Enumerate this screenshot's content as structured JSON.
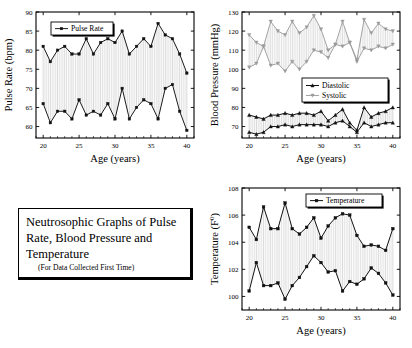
{
  "figure": {
    "caption": {
      "title_line1": "Neutrosophic Graphs of Pulse",
      "title_line2": "Rate, Blood Pressure and",
      "title_line3": "Temperature",
      "subtitle": "(For Data Collected First Time)"
    }
  },
  "chart_data": [
    {
      "id": "pulse",
      "type": "line",
      "title": "",
      "xlabel": "Age (years)",
      "ylabel": "Pulse Rate (bpm)",
      "xlim": [
        19,
        41
      ],
      "ylim": [
        57,
        90
      ],
      "xticks": [
        20,
        25,
        30,
        35,
        40
      ],
      "yticks": [
        60,
        65,
        70,
        75,
        80,
        85,
        90
      ],
      "grid": false,
      "legend": [
        "Pulse Rate"
      ],
      "legend_position": "top-left-inside",
      "x": [
        20,
        21,
        22,
        23,
        24,
        25,
        26,
        27,
        28,
        29,
        30,
        31,
        32,
        33,
        34,
        35,
        36,
        37,
        38,
        39,
        40
      ],
      "series": [
        {
          "name": "Pulse Rate Upper",
          "values": [
            81,
            77,
            80,
            81,
            79,
            79,
            83,
            79,
            82,
            83,
            82,
            85,
            79,
            81,
            83,
            81,
            87,
            84,
            83,
            79,
            74
          ]
        },
        {
          "name": "Pulse Rate Lower",
          "values": [
            66,
            61,
            64,
            64,
            62,
            67,
            63,
            64,
            63,
            66,
            62,
            70,
            62,
            65,
            67,
            66,
            62,
            70,
            71,
            64,
            59
          ]
        }
      ]
    },
    {
      "id": "blood-pressure",
      "type": "line",
      "title": "",
      "xlabel": "Age (years)",
      "ylabel": "Blood Pressure (mmHg)",
      "xlim": [
        19,
        41
      ],
      "ylim": [
        64,
        130
      ],
      "xticks": [
        20,
        25,
        30,
        35,
        40
      ],
      "yticks": [
        70,
        80,
        90,
        100,
        110,
        120,
        130
      ],
      "grid": false,
      "legend": [
        "Diastolic",
        "Systolic"
      ],
      "legend_position": "center-right-inside",
      "x": [
        20,
        21,
        22,
        23,
        24,
        25,
        26,
        27,
        28,
        29,
        30,
        31,
        32,
        33,
        34,
        35,
        36,
        37,
        38,
        39,
        40
      ],
      "series": [
        {
          "name": "Systolic Upper",
          "values": [
            118,
            114,
            112,
            125,
            120,
            118,
            125,
            119,
            122,
            128,
            121,
            110,
            113,
            125,
            114,
            105,
            126,
            119,
            124,
            121,
            120
          ]
        },
        {
          "name": "Systolic Lower",
          "values": [
            101,
            103,
            112,
            102,
            103,
            99,
            104,
            100,
            104,
            110,
            109,
            106,
            113,
            112,
            114,
            104,
            111,
            110,
            112,
            111,
            113
          ]
        },
        {
          "name": "Diastolic Upper",
          "values": [
            76,
            75,
            74,
            76,
            76,
            77,
            76,
            77,
            77,
            76,
            78,
            73,
            76,
            79,
            72,
            68,
            80,
            75,
            77,
            78,
            80
          ]
        },
        {
          "name": "Diastolic Lower",
          "values": [
            67,
            66,
            67,
            70,
            70,
            71,
            70,
            71,
            71,
            71,
            71,
            70,
            72,
            73,
            70,
            67,
            72,
            70,
            71,
            72,
            72
          ]
        }
      ]
    },
    {
      "id": "temperature",
      "type": "line",
      "title": "",
      "xlabel": "Age (years)",
      "ylabel": "Temperature (F⁰)",
      "xlim": [
        19,
        41
      ],
      "ylim": [
        99,
        108
      ],
      "xticks": [
        20,
        25,
        30,
        35,
        40
      ],
      "yticks": [
        100,
        102,
        104,
        106,
        108
      ],
      "grid": false,
      "legend": [
        "Temperature"
      ],
      "legend_position": "top-right-inside",
      "x": [
        20,
        21,
        22,
        23,
        24,
        25,
        26,
        27,
        28,
        29,
        30,
        31,
        32,
        33,
        34,
        35,
        36,
        37,
        38,
        39,
        40
      ],
      "series": [
        {
          "name": "Temperature Upper",
          "values": [
            105.1,
            104.2,
            106.6,
            105.0,
            105.0,
            106.9,
            105.0,
            104.6,
            105.1,
            105.8,
            104.3,
            105.2,
            105.8,
            106.1,
            106.0,
            104.5,
            103.7,
            103.8,
            103.7,
            103.4,
            105.0
          ]
        },
        {
          "name": "Temperature Lower",
          "values": [
            100.4,
            102.5,
            100.8,
            100.8,
            101.0,
            99.8,
            100.8,
            101.4,
            102.2,
            103.0,
            102.5,
            101.8,
            101.9,
            100.4,
            101.1,
            100.9,
            101.3,
            102.1,
            101.7,
            101.0,
            100.1
          ]
        }
      ]
    }
  ]
}
